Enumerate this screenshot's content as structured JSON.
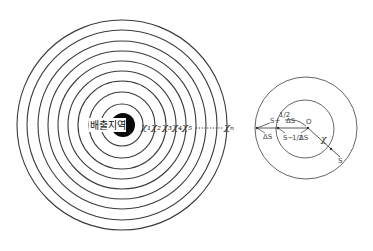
{
  "left_diagram": {
    "source_label": "배출지역",
    "ring_count": 9,
    "ring_labels": [
      "χ₁",
      "χ₂",
      "χ₃",
      "χ₄",
      "χ₅"
    ],
    "last_label": "χₙ",
    "dots": "··········"
  },
  "right_diagram": {
    "center_label": "O",
    "radius_label": "χ",
    "endpoint_label": "S",
    "outer_label": "S + ½ΔS",
    "inner_label": "S − ½ΔS",
    "delta_label": "ΔS",
    "upper_top": "S+",
    "upper_frac": "1/2",
    "upper_ds": "ΔS",
    "lower_s": "S−",
    "lower_frac": "1/2",
    "lower_ds": "ΔS"
  }
}
